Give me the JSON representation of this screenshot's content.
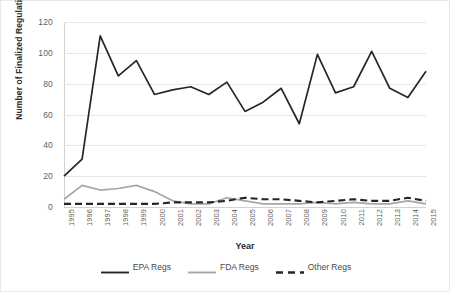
{
  "chart_data": {
    "type": "line",
    "title": "",
    "xlabel": "Year",
    "ylabel": "Number of Finalized Regulations",
    "categories": [
      "1995",
      "1996",
      "1997",
      "1998",
      "1999",
      "2000",
      "2001",
      "2002",
      "2003",
      "2004",
      "2005",
      "2006",
      "2007",
      "2008",
      "2009",
      "2010",
      "2011",
      "2012",
      "2013",
      "2014",
      "2015"
    ],
    "x": [
      1995,
      1996,
      1997,
      1998,
      1999,
      2000,
      2001,
      2002,
      2003,
      2004,
      2005,
      2006,
      2007,
      2008,
      2009,
      2010,
      2011,
      2012,
      2013,
      2014,
      2015
    ],
    "ylim": [
      0,
      120
    ],
    "yticks": [
      0,
      20,
      40,
      60,
      80,
      100,
      120
    ],
    "grid": true,
    "legend_position": "bottom",
    "series": [
      {
        "name": "EPA Regs",
        "color": "#262626",
        "style": "solid",
        "values": [
          20,
          31,
          111,
          85,
          95,
          73,
          76,
          78,
          73,
          81,
          62,
          68,
          77,
          54,
          99,
          74,
          78,
          101,
          77,
          71,
          88
        ]
      },
      {
        "name": "FDA Regs",
        "color": "#a6a6a6",
        "style": "solid",
        "values": [
          5,
          14,
          11,
          12,
          14,
          10,
          4,
          2,
          2,
          6,
          4,
          2,
          2,
          2,
          3,
          2,
          3,
          2,
          2,
          4,
          2
        ]
      },
      {
        "name": "Other Regs",
        "color": "#262626",
        "style": "dashed",
        "values": [
          2,
          2,
          2,
          2,
          2,
          2,
          3,
          3,
          3,
          4,
          6,
          5,
          5,
          4,
          3,
          4,
          5,
          4,
          4,
          6,
          4
        ]
      }
    ]
  },
  "axes": {
    "y_title": "Number of Finalized Regulations",
    "x_title": "Year",
    "y_tick_labels": [
      "0",
      "20",
      "40",
      "60",
      "80",
      "100",
      "120"
    ]
  },
  "legend": {
    "items": [
      {
        "label": "EPA Regs"
      },
      {
        "label": "FDA Regs"
      },
      {
        "label": "Other Regs"
      }
    ]
  },
  "colors": {
    "epa": "#262626",
    "fda": "#a6a6a6",
    "other": "#262626",
    "grid": "#e6e6e6",
    "axis": "#d2d2d2",
    "tick_text": "#5f5f5f",
    "title_text": "#2b2b2b",
    "background": "#ffffff"
  }
}
